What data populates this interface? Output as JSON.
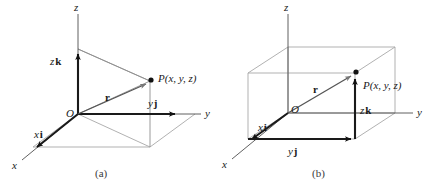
{
  "figure": {
    "title_present": false,
    "background_color": "#ffffff",
    "panels": [
      {
        "id": "a",
        "caption": "(a)",
        "axes": [
          {
            "name": "z-axis-label",
            "label": "z"
          },
          {
            "name": "y-axis-label",
            "label": "y"
          },
          {
            "name": "x-axis-label",
            "label": "x"
          }
        ],
        "origin_label": "O",
        "point_label": "P(x, y, z)",
        "vectors": [
          {
            "name": "position-vector",
            "label": "r"
          },
          {
            "name": "x-component-vector",
            "label_italic": "x",
            "label_bold": "i"
          },
          {
            "name": "y-component-vector",
            "label_italic": "y",
            "label_bold": "j"
          },
          {
            "name": "z-component-vector",
            "label_italic": "z",
            "label_bold": "k"
          }
        ]
      },
      {
        "id": "b",
        "caption": "(b)",
        "axes": [
          {
            "name": "z-axis-label",
            "label": "z"
          },
          {
            "name": "y-axis-label",
            "label": "y"
          },
          {
            "name": "x-axis-label",
            "label": "x"
          }
        ],
        "origin_label": "O",
        "point_label": "P(x, y, z)",
        "vectors": [
          {
            "name": "position-vector",
            "label": "r"
          },
          {
            "name": "x-component-vector",
            "label_italic": "x",
            "label_bold": "i"
          },
          {
            "name": "y-component-vector",
            "label_italic": "y",
            "label_bold": "j"
          },
          {
            "name": "z-component-vector",
            "label_italic": "z",
            "label_bold": "k"
          }
        ]
      }
    ],
    "colors": {
      "ink": "#1a1a1a",
      "thin_axis": "#4f4f4f",
      "construction_grey": "#8f8f8f",
      "arrow_grey": "#777777"
    }
  },
  "panel_a": {
    "z_axis_label": "z",
    "y_axis_label": "y",
    "x_axis_label": "x",
    "origin": "O",
    "point": "P(x, y, z)",
    "r": "r",
    "xi_italic": "x",
    "xi_bold": "i",
    "yj_italic": "y",
    "yj_bold": "j",
    "zk_italic": "z",
    "zk_bold": "k",
    "caption": "(a)"
  },
  "panel_b": {
    "z_axis_label": "z",
    "y_axis_label": "y",
    "x_axis_label": "x",
    "origin": "O",
    "point": "P(x, y, z)",
    "r": "r",
    "xi_italic": "x",
    "xi_bold": "i",
    "yj_italic": "y",
    "yj_bold": "j",
    "zk_italic": "z",
    "zk_bold": "k",
    "caption": "(b)"
  }
}
